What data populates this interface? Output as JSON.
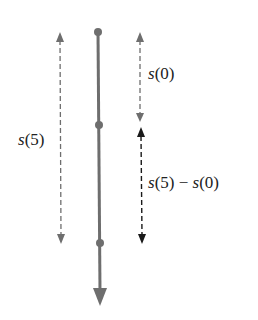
{
  "labels": {
    "s5_func": "s",
    "s5_arg": "(5)",
    "s0_func": "s",
    "s0_arg": "(0)",
    "diff_f1": "s",
    "diff_a1": "(5)",
    "diff_op": " − ",
    "diff_f2": "s",
    "diff_a2": "(0)"
  },
  "colors": {
    "gray": "#6e6e6e",
    "black": "#1a1a1a"
  }
}
